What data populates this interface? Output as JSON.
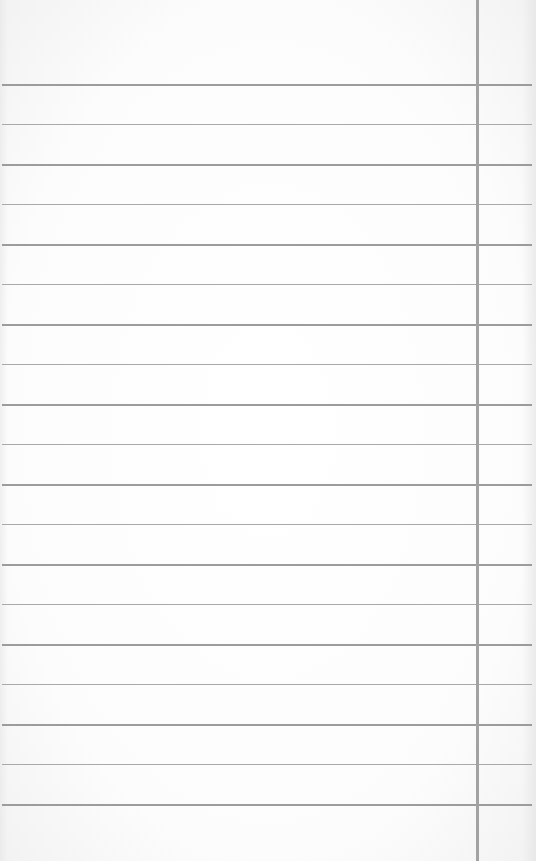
{
  "paper": {
    "type": "lined-paper",
    "background_color": "#fbfbfb",
    "rule_color": "#a9a9a9",
    "margin_line_color": "#a2a2a2",
    "margin_line_x": 476,
    "first_rule_y": 84,
    "rule_spacing": 40,
    "rule_count": 19
  }
}
